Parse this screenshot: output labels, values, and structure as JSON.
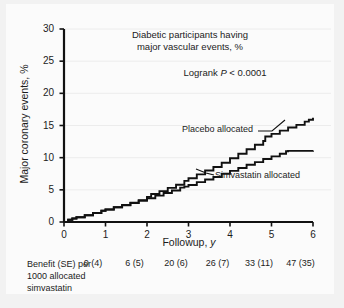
{
  "figure": {
    "background_color": "#f2f2f2",
    "panel_color": "#fbfbfb",
    "line_color": "#111111",
    "grid_color": "#ececec"
  },
  "chart_data": {
    "type": "line",
    "title": "Diabetic participants having major vascular events, %",
    "title_line1": "Diabetic participants having",
    "title_line2": "major vascular events, %",
    "annotation_logrank_prefix": "Logrank ",
    "annotation_logrank_italic": "P",
    "annotation_logrank_suffix": " < 0.0001",
    "xlabel_prefix": "Followup, ",
    "xlabel_italic": "y",
    "ylabel": "Major coronary events, %",
    "xlim": [
      0,
      6
    ],
    "ylim": [
      0,
      30
    ],
    "xticks": [
      0,
      1,
      2,
      3,
      4,
      5,
      6
    ],
    "xtick_labels": [
      "0",
      "1",
      "2",
      "3",
      "4",
      "5",
      "6"
    ],
    "yticks": [
      0,
      5,
      10,
      15,
      20,
      25,
      30
    ],
    "ytick_labels": [
      "0",
      "5",
      "10",
      "15",
      "20",
      "25",
      "30"
    ],
    "grid": true,
    "grid_axis": "y",
    "legend_position": "inline-annotations",
    "series": [
      {
        "name": "Placebo allocated",
        "label": "Placebo allocated",
        "x": [
          0,
          0.1,
          0.2,
          0.3,
          0.5,
          0.7,
          0.9,
          1.0,
          1.2,
          1.4,
          1.6,
          1.8,
          2.0,
          2.1,
          2.3,
          2.5,
          2.7,
          2.9,
          3.0,
          3.2,
          3.4,
          3.6,
          3.8,
          4.0,
          4.2,
          4.4,
          4.6,
          4.8,
          4.85,
          5.0,
          5.2,
          5.4,
          5.6,
          5.8,
          5.9,
          6.0
        ],
        "y": [
          0.0,
          0.35,
          0.55,
          0.75,
          1.05,
          1.4,
          1.75,
          1.95,
          2.3,
          2.65,
          3.0,
          3.4,
          3.9,
          4.35,
          4.8,
          5.3,
          5.8,
          6.4,
          6.8,
          7.4,
          8.0,
          8.55,
          9.2,
          9.9,
          10.6,
          11.3,
          12.0,
          12.6,
          13.3,
          13.7,
          14.2,
          14.7,
          15.1,
          15.6,
          15.9,
          16.2
        ]
      },
      {
        "name": "Simvastatin allocated",
        "label": "Simvastatin allocated",
        "x": [
          0,
          0.1,
          0.2,
          0.3,
          0.5,
          0.7,
          0.9,
          1.0,
          1.2,
          1.4,
          1.6,
          1.8,
          2.0,
          2.2,
          2.4,
          2.6,
          2.8,
          2.9,
          3.0,
          3.2,
          3.4,
          3.6,
          3.8,
          4.0,
          4.2,
          4.4,
          4.6,
          4.8,
          5.0,
          5.2,
          5.35,
          5.4,
          5.7,
          6.0
        ],
        "y": [
          0.0,
          0.35,
          0.55,
          0.75,
          1.05,
          1.4,
          1.75,
          1.95,
          2.3,
          2.6,
          2.95,
          3.3,
          3.7,
          4.1,
          4.5,
          4.9,
          5.35,
          5.5,
          5.75,
          6.2,
          6.6,
          7.0,
          7.5,
          7.95,
          8.4,
          8.9,
          9.3,
          9.8,
          10.2,
          10.6,
          11.0,
          11.05,
          11.05,
          11.1
        ]
      }
    ]
  },
  "benefit_row": {
    "label": "Benefit (SE) per 1000 allocated simvastatin",
    "label_line1": "Benefit (SE) per",
    "label_line2": "1000 allocated",
    "label_line3": "simvastatin",
    "values": [
      "0 (4)",
      "6 (5)",
      "20 (6)",
      "26 (7)",
      "33 (11)",
      "47 (35)"
    ]
  }
}
